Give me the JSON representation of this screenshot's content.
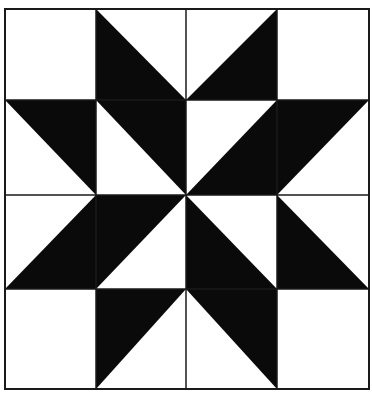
{
  "diagram": {
    "title": "",
    "type": "quilt-block",
    "pattern_name": "eight-point star (pinwheel center)",
    "colors": {
      "dark": "#0a0a0a",
      "light": "#ffffff",
      "line": "#1a1a1a"
    },
    "frame": {
      "x": 5,
      "y": 9,
      "right": 369,
      "bottom": 389
    },
    "grid": {
      "rows": 4,
      "cols": 4,
      "col_lines": [
        5,
        96,
        186,
        277,
        369
      ],
      "row_lines": [
        9,
        100,
        195,
        289,
        389
      ]
    },
    "cells": [
      [
        "empty",
        "TL-BL-BR",
        "TR-BR-BL",
        "empty"
      ],
      [
        "TL-TR-BR",
        "TL-TR-BR",
        "TR-BR-BL",
        "TL-TR-BL"
      ],
      [
        "TR-BR-BL",
        "TL-TR-BL",
        "TL-BL-BR",
        "TL-BL-BR"
      ],
      [
        "empty",
        "TL-TR-BL",
        "TL-TR-BR",
        "empty"
      ]
    ]
  }
}
